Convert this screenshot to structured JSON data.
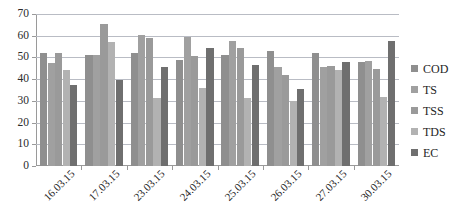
{
  "chart_data": {
    "type": "bar",
    "title": "",
    "subtitle": "",
    "xlabel": "",
    "ylabel": "",
    "ylim": [
      0,
      70
    ],
    "yticks": [
      0,
      10,
      20,
      30,
      40,
      50,
      60,
      70
    ],
    "grid": true,
    "legend_position": "right",
    "categories": [
      "16.03.15",
      "17.03.15",
      "23.03.15",
      "24.03.15",
      "25.03.15",
      "26.03.15",
      "27.03.15",
      "30.03.15"
    ],
    "series": [
      {
        "name": "COD",
        "color": "#8f8f8f",
        "values": [
          52,
          51,
          52,
          49,
          51,
          53,
          52,
          48
        ]
      },
      {
        "name": "TS",
        "color": "#a0a0a0",
        "values": [
          47.5,
          51,
          60.5,
          59.5,
          57.5,
          45.5,
          45.5,
          48.5
        ]
      },
      {
        "name": "TSS",
        "color": "#9a9a9a",
        "values": [
          52,
          65.5,
          59,
          50.5,
          54.5,
          42,
          46,
          44.5
        ]
      },
      {
        "name": "TDS",
        "color": "#b2b2b2",
        "values": [
          44,
          57,
          31.5,
          36,
          31.5,
          30,
          44,
          32
        ]
      },
      {
        "name": "EC",
        "color": "#6f6f6f",
        "values": [
          37.5,
          39.5,
          45.5,
          54.5,
          46.5,
          35.5,
          48,
          57.5
        ]
      }
    ]
  },
  "legend": {
    "items": [
      {
        "label": "COD",
        "color": "#8f8f8f"
      },
      {
        "label": "TS",
        "color": "#a0a0a0"
      },
      {
        "label": "TSS",
        "color": "#9a9a9a"
      },
      {
        "label": "TDS",
        "color": "#b2b2b2"
      },
      {
        "label": "EC",
        "color": "#6f6f6f"
      }
    ]
  },
  "axis": {
    "y_ticks": [
      "0",
      "10",
      "20",
      "30",
      "40",
      "50",
      "60",
      "70"
    ],
    "x_ticks": [
      "16.03.15",
      "17.03.15",
      "23.03.15",
      "24.03.15",
      "25.03.15",
      "26.03.15",
      "27.03.15",
      "30.03.15"
    ]
  }
}
